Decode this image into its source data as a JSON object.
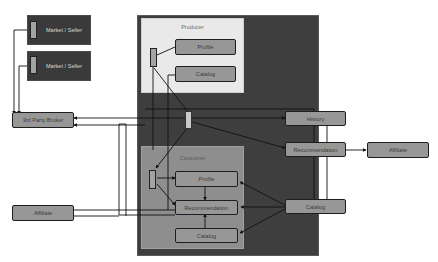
{
  "diagram": {
    "type": "architecture-block-diagram",
    "colors": {
      "background": "#ffffff",
      "platform": "#3e3e3e",
      "producer_zone": "#e9e9e9",
      "consumer_zone": "#8e8e8e",
      "node_fill": "#979797",
      "node_border": "#1e1e1e",
      "connector": "#111111"
    },
    "external": {
      "sellers": [
        {
          "label": "Market / Seller"
        },
        {
          "label": "Market / Seller"
        }
      ],
      "broker": {
        "label": "3rd Party Broker"
      },
      "affiliate_left": {
        "label": "Affiliate"
      },
      "affiliate_right": {
        "label": "Affiliate"
      }
    },
    "producer": {
      "title": "Producer",
      "nodes": [
        {
          "label": "Profile"
        },
        {
          "label": "Catalog"
        }
      ]
    },
    "consumer": {
      "title": "Consumer",
      "nodes": [
        {
          "label": "Profile"
        },
        {
          "label": "Recommendation"
        },
        {
          "label": "Catalog"
        }
      ]
    },
    "platform_nodes": {
      "history": {
        "label": "History"
      },
      "recommendation": {
        "label": "Recommendation"
      },
      "catalog": {
        "label": "Catalog"
      }
    },
    "edges": [
      {
        "from": "Market / Seller (1)",
        "to": "3rd Party Broker"
      },
      {
        "from": "Market / Seller (2)",
        "to": "3rd Party Broker"
      },
      {
        "from": "Central hub",
        "to": "3rd Party Broker"
      },
      {
        "from": "Producer hub",
        "to": "Producer Profile"
      },
      {
        "from": "Producer hub",
        "to": "Producer Catalog"
      },
      {
        "from": "Central hub",
        "to": "History"
      },
      {
        "from": "Central hub",
        "to": "Recommendation"
      },
      {
        "from": "Recommendation",
        "to": "Affiliate (right)"
      },
      {
        "from": "History",
        "to": "Catalog"
      },
      {
        "from": "Catalog",
        "to": "Consumer Profile"
      },
      {
        "from": "Catalog",
        "to": "Consumer Recommendation"
      },
      {
        "from": "Catalog",
        "to": "Consumer Catalog"
      },
      {
        "from": "Consumer hub",
        "to": "Consumer Profile"
      },
      {
        "from": "Consumer hub",
        "to": "Consumer Recommendation"
      },
      {
        "from": "Consumer Profile",
        "to": "Consumer Recommendation"
      },
      {
        "from": "Consumer Catalog",
        "to": "Consumer Recommendation"
      },
      {
        "from": "Consumer Recommendation",
        "to": "Affiliate (left)"
      }
    ]
  }
}
